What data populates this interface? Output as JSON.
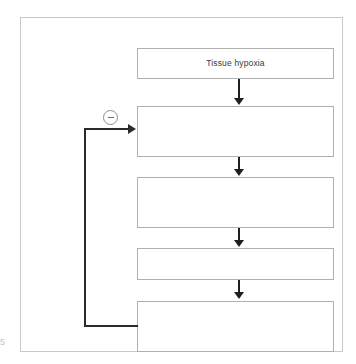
{
  "diagram": {
    "frame_border_color": "#c9c9c9",
    "box_border_color": "#b0b0b0",
    "arrow_color": "#1e1e1e",
    "feedback_color": "#2b2b2b",
    "boxes": [
      {
        "id": "box-1",
        "label": "Tissue hypoxia"
      },
      {
        "id": "box-2",
        "label": ""
      },
      {
        "id": "box-3",
        "label": ""
      },
      {
        "id": "box-4",
        "label": ""
      },
      {
        "id": "box-5",
        "label": ""
      }
    ],
    "feedback": {
      "sign_symbol": "−",
      "icon_name": "circled-minus-icon",
      "from_box": "box-5",
      "to_box": "box-2"
    },
    "margin_mark": "5"
  }
}
